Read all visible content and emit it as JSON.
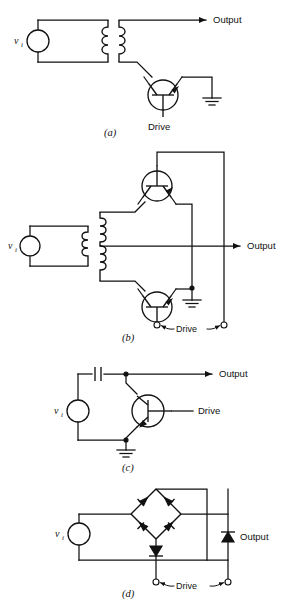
{
  "figure": {
    "width": 292,
    "height": 605,
    "ink_color": "#111111",
    "background_color": "#ffffff"
  },
  "labels": {
    "output": "Output",
    "drive": "Drive",
    "source_symbol": "v",
    "source_subscript": "i"
  },
  "panels": [
    {
      "id": "a",
      "caption": "(a)",
      "description": "Series chopper: input source drives transformer primary; secondary feeds a single transistor switch to ground, output taken from secondary top lead.",
      "components": [
        {
          "name": "input-source",
          "type": "ac-source",
          "label": "v_i"
        },
        {
          "name": "transformer",
          "type": "transformer",
          "windings": 2
        },
        {
          "name": "transistor",
          "type": "npn-transistor",
          "count": 1
        },
        {
          "name": "ground",
          "type": "ground",
          "count": 1
        }
      ],
      "terminals": [
        "Output",
        "Drive"
      ]
    },
    {
      "id": "b",
      "caption": "(b)",
      "description": "Balanced/series-shunt chopper: center-tapped transformer secondary drives two transistors (upper and lower) in a bridge arrangement with grounded center and differential drive terminals.",
      "components": [
        {
          "name": "input-source",
          "type": "ac-source",
          "label": "v_i"
        },
        {
          "name": "transformer",
          "type": "center-tapped-transformer",
          "windings": 2
        },
        {
          "name": "transistor-top",
          "type": "npn-transistor",
          "count": 1
        },
        {
          "name": "transistor-bottom",
          "type": "npn-transistor",
          "count": 1
        },
        {
          "name": "ground",
          "type": "ground",
          "count": 1
        },
        {
          "name": "drive-terminals",
          "type": "open-terminal",
          "count": 2
        }
      ],
      "terminals": [
        "Output",
        "Drive"
      ]
    },
    {
      "id": "c",
      "caption": "(c)",
      "description": "Shunt chopper: input source through a series capacitor to the output node; transistor shunts node to ground, base driven from the right.",
      "components": [
        {
          "name": "input-source",
          "type": "ac-source",
          "label": "v_i"
        },
        {
          "name": "capacitor",
          "type": "capacitor",
          "count": 1
        },
        {
          "name": "transistor",
          "type": "npn-transistor",
          "count": 1
        },
        {
          "name": "ground",
          "type": "ground",
          "count": 1
        }
      ],
      "terminals": [
        "Output",
        "Drive"
      ]
    },
    {
      "id": "d",
      "caption": "(d)",
      "description": "Diode-bridge chopper: four diodes in a bridge diamond fed by the input source, with a fifth series diode to the drive terminals and output taken across the right-hand branch.",
      "components": [
        {
          "name": "input-source",
          "type": "ac-source",
          "label": "v_i"
        },
        {
          "name": "diode-bridge",
          "type": "diode",
          "count": 4
        },
        {
          "name": "series-diode",
          "type": "diode",
          "count": 1
        },
        {
          "name": "output-diode",
          "type": "diode",
          "count": 1
        },
        {
          "name": "drive-terminals",
          "type": "open-terminal",
          "count": 2
        }
      ],
      "terminals": [
        "Output",
        "Drive"
      ]
    }
  ]
}
